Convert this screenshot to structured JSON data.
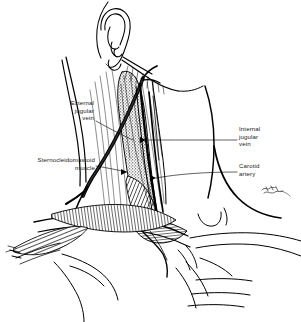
{
  "figure": {
    "background_color": "#ffffff",
    "ink_color": "#000000",
    "width": 301,
    "height": 322,
    "orientation": "left lateral / anterolateral view of head, neck and shoulder",
    "style": "pen-and-ink line drawing with stipple and cross-hatch shading"
  },
  "labels": {
    "external_jugular_vein": "External\njugular\nvein",
    "sternocleidomastoid_muscle": "Sternocleidomastoid\nmuscle",
    "internal_jugular_vein": "Internal\njugular\nvein",
    "carotid_artery": "Carotid\nartery"
  },
  "structures": {
    "ear": "auricle with helix, antihelix, concha, tragus and lobule",
    "mandible": "jawline and submandibular border",
    "sternocleidomastoid": "sternocleidomastoid muscle, stipple shaded, running from mastoid to clavicle",
    "external_jugular": "external jugular vein crossing the sternocleidomastoid obliquely",
    "internal_jugular": "internal jugular vein deep to sternocleidomastoid",
    "carotid_artery": "common carotid artery deep and medial to internal jugular",
    "clavicle": "clavicle forming the inferior border of the posterior triangle",
    "trapezius": "trapezius muscle forming the posterior border of the neck",
    "shoulder": "deltoid and shoulder contour at lower right",
    "chest": "upper chest and pectoral contour lines"
  },
  "signature": {
    "present": true,
    "description": "small illustrator signature mark at right",
    "text": ""
  }
}
